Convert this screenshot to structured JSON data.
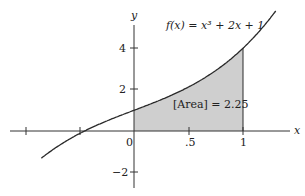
{
  "chart_data": {
    "type": "area",
    "title": "f(x) = x³ + 2x + 1",
    "function": "x^3 + 2x + 1",
    "xlabel": "x",
    "ylabel": "y",
    "x_ticks": [
      "",
      "",
      "0",
      ".5",
      "1"
    ],
    "x_tick_values": [
      -1,
      -0.5,
      0,
      0.5,
      1
    ],
    "y_ticks": [
      "4",
      "2",
      "−2"
    ],
    "y_tick_values": [
      4,
      2,
      -2
    ],
    "xlim": [
      -1.15,
      1.4
    ],
    "ylim": [
      -2.8,
      5.9
    ],
    "shaded_interval": [
      0,
      1
    ],
    "annotation": "[Area] = 2.25",
    "area_value": 2.25,
    "curve_points": [
      {
        "x": -0.8,
        "y": -1.11
      },
      {
        "x": -0.6,
        "y": -0.42
      },
      {
        "x": -0.45,
        "y": 0.01
      },
      {
        "x": -0.2,
        "y": 0.59
      },
      {
        "x": 0,
        "y": 1
      },
      {
        "x": 0.25,
        "y": 1.52
      },
      {
        "x": 0.5,
        "y": 2.13
      },
      {
        "x": 0.75,
        "y": 2.92
      },
      {
        "x": 1,
        "y": 4
      },
      {
        "x": 1.2,
        "y": 5.13
      },
      {
        "x": 1.3,
        "y": 5.8
      }
    ],
    "colors": {
      "curve": "#2a2a2a",
      "fill": "#cfcfcf",
      "axis": "#333333"
    },
    "grid": false
  },
  "labels": {
    "title": "f(x) = x³ + 2x + 1",
    "x_axis": "x",
    "y_axis": "y",
    "tick_0": "0",
    "tick_half": ".5",
    "tick_1": "1",
    "tick_y4": "4",
    "tick_y2": "2",
    "tick_ym2": "−2",
    "area": "[Area] = 2.25"
  }
}
